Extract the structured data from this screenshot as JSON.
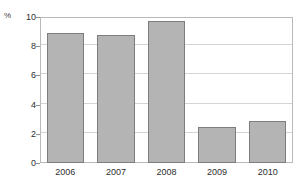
{
  "chart_data": {
    "type": "bar",
    "title": "",
    "xlabel": "",
    "ylabel": "%",
    "categories": [
      "2006",
      "2007",
      "2008",
      "2009",
      "2010"
    ],
    "values": [
      8.9,
      8.8,
      9.7,
      2.5,
      2.9
    ],
    "ylim": [
      0,
      10
    ],
    "ytick_labels": [
      "0",
      "2",
      "4",
      "6",
      "8",
      "10"
    ],
    "ytick_values": [
      0,
      2,
      4,
      6,
      8,
      10
    ],
    "grid": "horizontal",
    "legend": "none",
    "series": [
      {
        "name": "",
        "values": [
          8.9,
          8.8,
          9.7,
          2.5,
          2.9
        ]
      }
    ],
    "colors": {
      "bar_fill": "#b4b4b4",
      "bar_border": "#7d7d7d",
      "gridline": "#d4d4d4",
      "frame": "#b9b9b9",
      "text": "#2e2e2e",
      "background": "#ffffff"
    }
  }
}
